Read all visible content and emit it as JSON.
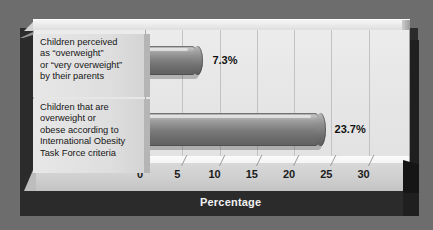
{
  "chart_data": {
    "type": "bar",
    "orientation": "horizontal",
    "title": "",
    "xlabel": "Percentage",
    "ylabel": "",
    "xlim": [
      0,
      33
    ],
    "xticks": [
      0,
      5,
      10,
      15,
      20,
      25,
      30
    ],
    "xtick_labels": [
      "0",
      "5",
      "10",
      "15",
      "20",
      "25",
      "30"
    ],
    "grid": true,
    "legend": false,
    "style": "3d-cylinder-bars",
    "categories": [
      "Children perceived as \"overweight\" or \"very overweight\" by their parents",
      "Children that are overweight or obese according to International Obesity Task Force criteria"
    ],
    "values": [
      7.3,
      23.7
    ],
    "data_labels": [
      "7.3%",
      "23.7%"
    ]
  },
  "axis": {
    "title": "Percentage",
    "ticks": [
      {
        "label": "0",
        "value": 0
      },
      {
        "label": "5",
        "value": 5
      },
      {
        "label": "10",
        "value": 10
      },
      {
        "label": "15",
        "value": 15
      },
      {
        "label": "20",
        "value": 20
      },
      {
        "label": "25",
        "value": 25
      },
      {
        "label": "30",
        "value": 30
      }
    ]
  },
  "bars": [
    {
      "label_lines": "Children perceived\nas “overweight”\nor “very overweight”\nby their parents",
      "value": 7.3,
      "value_label": "7.3%"
    },
    {
      "label_lines": "Children that are\noverweight or\nobese according to\nInternational Obesity\nTask Force criteria",
      "value": 23.7,
      "value_label": "23.7%"
    }
  ],
  "colors": {
    "outer_background": "#6d6d6d",
    "shadow_slab": "#2b2b2b",
    "plot_panel": "#e6e6e6",
    "floor": "#cfcfcf",
    "label_panel": "#dedede",
    "bar_fill": "#7c7c7c",
    "gridline": "#c2c2c2",
    "axis_title_text": "#f2f2f2",
    "tick_text": "#1b1b1b",
    "value_text": "#111111"
  }
}
